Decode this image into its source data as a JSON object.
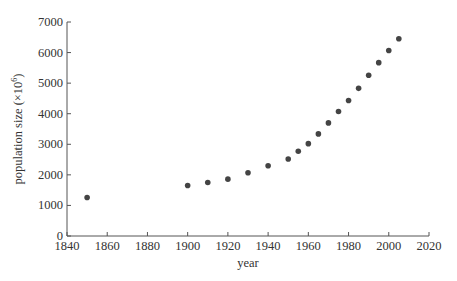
{
  "chart_data": {
    "type": "scatter",
    "title": "",
    "xlabel": "year",
    "ylabel": "population size (×10⁶)",
    "ylabel_base": "population size (×10",
    "ylabel_exp": "6",
    "ylabel_close": ")",
    "xlim": [
      1840,
      2020
    ],
    "ylim": [
      0,
      7000
    ],
    "xticks": [
      1840,
      1860,
      1880,
      1900,
      1920,
      1940,
      1960,
      1980,
      2000,
      2020
    ],
    "yticks": [
      0,
      1000,
      2000,
      3000,
      4000,
      5000,
      6000,
      7000
    ],
    "grid": false,
    "legend": null,
    "series": [
      {
        "name": "world population",
        "points": [
          {
            "x": 1850,
            "y": 1260
          },
          {
            "x": 1900,
            "y": 1650
          },
          {
            "x": 1910,
            "y": 1750
          },
          {
            "x": 1920,
            "y": 1860
          },
          {
            "x": 1930,
            "y": 2070
          },
          {
            "x": 1940,
            "y": 2300
          },
          {
            "x": 1950,
            "y": 2520
          },
          {
            "x": 1955,
            "y": 2770
          },
          {
            "x": 1960,
            "y": 3020
          },
          {
            "x": 1965,
            "y": 3340
          },
          {
            "x": 1970,
            "y": 3700
          },
          {
            "x": 1975,
            "y": 4070
          },
          {
            "x": 1980,
            "y": 4430
          },
          {
            "x": 1985,
            "y": 4830
          },
          {
            "x": 1990,
            "y": 5260
          },
          {
            "x": 1995,
            "y": 5670
          },
          {
            "x": 2000,
            "y": 6070
          },
          {
            "x": 2005,
            "y": 6450
          }
        ]
      }
    ]
  },
  "colors": {
    "axis": "#555555",
    "marker": "#444444",
    "text": "#333333"
  }
}
